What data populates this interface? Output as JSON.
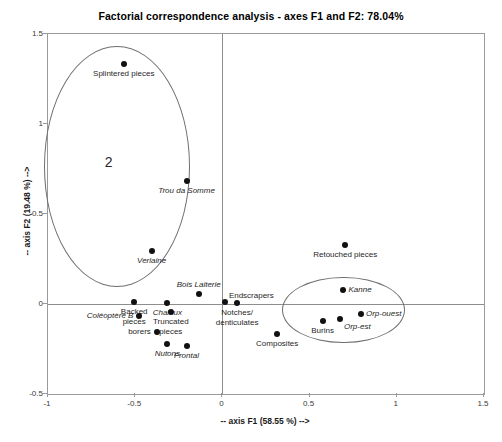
{
  "chart_data": {
    "type": "scatter",
    "title": "Factorial correspondence analysis - axes F1 and F2: 78.04%",
    "xlabel": "-- axis F1 (58.55 %) -->",
    "ylabel": "-- axis F2 (19.48 %) -->",
    "xlim": [
      -1,
      1.5
    ],
    "ylim": [
      -0.5,
      1.5
    ],
    "xticks": [
      "-1",
      "-0.5",
      "0",
      "0.5",
      "1",
      "1.5"
    ],
    "xtick_values": [
      -1,
      -0.5,
      0,
      0.5,
      1,
      1.5
    ],
    "yticks": [
      "-0.5",
      "0",
      "0.5",
      "1",
      "1.5"
    ],
    "ytick_values": [
      -0.5,
      0,
      0.5,
      1,
      1.5
    ],
    "grid": false,
    "legend": "none",
    "points": [
      {
        "label": "Splintered pieces",
        "x": -0.56,
        "y": 1.33,
        "italic": false,
        "label_pos": "below-center"
      },
      {
        "label": "Trou da Somme",
        "x": -0.2,
        "y": 0.68,
        "italic": true,
        "label_pos": "below-center"
      },
      {
        "label": "Verlaine",
        "x": -0.4,
        "y": 0.29,
        "italic": true,
        "label_pos": "below-center"
      },
      {
        "label": "Bois Laiterie",
        "x": -0.13,
        "y": 0.05,
        "italic": true,
        "label_pos": "above-center"
      },
      {
        "label": "Retouched pieces",
        "x": 0.71,
        "y": 0.32,
        "italic": false,
        "label_pos": "below-center"
      },
      {
        "label": "Kanne",
        "x": 0.7,
        "y": 0.07,
        "italic": true,
        "label_pos": "right"
      },
      {
        "label": "Endscrapers",
        "x": 0.02,
        "y": 0.005,
        "italic": false,
        "label_pos": "above-right"
      },
      {
        "label": "Notches/\ndenticulates",
        "x": 0.09,
        "y": 0.0,
        "italic": false,
        "label_pos": "below-center"
      },
      {
        "label": "Backed\npieces",
        "x": -0.5,
        "y": 0.005,
        "italic": false,
        "label_pos": "below-center"
      },
      {
        "label": "Chaleux",
        "x": -0.31,
        "y": 0.0,
        "italic": true,
        "label_pos": "below-center"
      },
      {
        "label": "Coléoptère B",
        "x": -0.47,
        "y": -0.07,
        "italic": true,
        "label_pos": "left"
      },
      {
        "label": "Truncated\npieces",
        "x": -0.29,
        "y": -0.05,
        "italic": false,
        "label_pos": "below-center"
      },
      {
        "label": "Orp-ouest",
        "x": 0.8,
        "y": -0.06,
        "italic": true,
        "label_pos": "right"
      },
      {
        "label": "Orp-est",
        "x": 0.68,
        "y": -0.09,
        "italic": true,
        "label_pos": "below-right"
      },
      {
        "label": "Burins",
        "x": 0.58,
        "y": -0.1,
        "italic": false,
        "label_pos": "below-center"
      },
      {
        "label": "borers",
        "x": -0.37,
        "y": -0.16,
        "italic": false,
        "label_pos": "left"
      },
      {
        "label": "Nutons",
        "x": -0.31,
        "y": -0.23,
        "italic": true,
        "label_pos": "below-center"
      },
      {
        "label": "Frontal",
        "x": -0.2,
        "y": -0.24,
        "italic": true,
        "label_pos": "below-center"
      },
      {
        "label": "Composites",
        "x": 0.32,
        "y": -0.17,
        "italic": false,
        "label_pos": "below-center"
      }
    ],
    "groups": [
      {
        "name": "2",
        "cx": -0.6,
        "cy": 0.76,
        "rx": 0.42,
        "ry": 0.67,
        "number_label": "2"
      },
      {
        "name": "right-cluster",
        "cx": 0.7,
        "cy": -0.04,
        "rx": 0.35,
        "ry": 0.185,
        "number_label": ""
      }
    ]
  }
}
